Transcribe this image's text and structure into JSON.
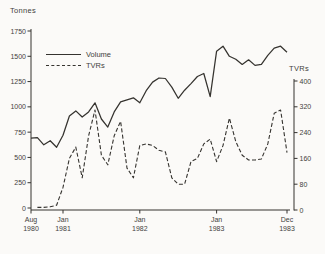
{
  "figure": {
    "background": "#fbfaf8",
    "line_color": "#35332f",
    "text_color": "#43413d"
  },
  "chart_data": {
    "type": "line",
    "title": "",
    "y_left": {
      "label": "Tonnes",
      "min": 0,
      "max": 1750,
      "tick_step": 250,
      "ticks": [
        0,
        250,
        500,
        750,
        1000,
        1250,
        1500,
        1750
      ]
    },
    "y_right": {
      "label": "TVRs",
      "min": 0,
      "max": 400,
      "tick_step": 80,
      "ticks": [
        0,
        80,
        160,
        240,
        320,
        400
      ]
    },
    "x": {
      "unit": "month",
      "start": "Aug 1980",
      "end": "Dec 1983",
      "n_points": 41,
      "months": [
        "1980-08",
        "1980-09",
        "1980-10",
        "1980-11",
        "1980-12",
        "1981-01",
        "1981-02",
        "1981-03",
        "1981-04",
        "1981-05",
        "1981-06",
        "1981-07",
        "1981-08",
        "1981-09",
        "1981-10",
        "1981-11",
        "1981-12",
        "1982-01",
        "1982-02",
        "1982-03",
        "1982-04",
        "1982-05",
        "1982-06",
        "1982-07",
        "1982-08",
        "1982-09",
        "1982-10",
        "1982-11",
        "1982-12",
        "1983-01",
        "1983-02",
        "1983-03",
        "1983-04",
        "1983-05",
        "1983-06",
        "1983-07",
        "1983-08",
        "1983-09",
        "1983-10",
        "1983-11",
        "1983-12"
      ],
      "tick_labels": [
        {
          "month": "Aug",
          "year": "1980",
          "index": 0
        },
        {
          "month": "Jan",
          "year": "1981",
          "index": 5
        },
        {
          "month": "Jan",
          "year": "1982",
          "index": 17
        },
        {
          "month": "Jan",
          "year": "1983",
          "index": 29
        },
        {
          "month": "Dec",
          "year": "1983",
          "index": 40
        }
      ]
    },
    "legend": {
      "position": "top-left-inside",
      "entries": [
        {
          "name": "Volume",
          "style": "solid"
        },
        {
          "name": "TVRs",
          "style": "dashed"
        }
      ]
    },
    "series": [
      {
        "name": "Volume",
        "axis": "left",
        "style": "solid",
        "values": [
          690,
          695,
          625,
          665,
          600,
          720,
          910,
          960,
          900,
          950,
          1040,
          880,
          800,
          950,
          1050,
          1070,
          1090,
          1040,
          1160,
          1245,
          1285,
          1280,
          1195,
          1085,
          1165,
          1230,
          1300,
          1330,
          1100,
          1550,
          1600,
          1500,
          1470,
          1420,
          1465,
          1410,
          1420,
          1510,
          1580,
          1600,
          1540
        ]
      },
      {
        "name": "TVRs",
        "axis": "right",
        "style": "dashed",
        "values": [
          null,
          8,
          8,
          10,
          15,
          70,
          160,
          195,
          100,
          230,
          310,
          170,
          140,
          230,
          275,
          130,
          100,
          200,
          205,
          200,
          185,
          180,
          100,
          80,
          80,
          150,
          160,
          205,
          220,
          150,
          200,
          285,
          212,
          170,
          155,
          155,
          158,
          205,
          300,
          310,
          178
        ]
      }
    ]
  }
}
